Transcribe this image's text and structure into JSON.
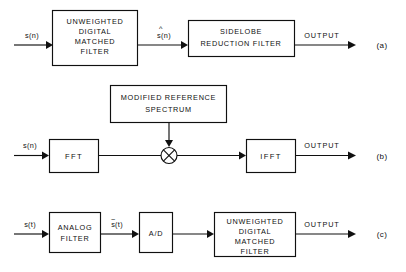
{
  "diagram": {
    "stroke_color": "#101010",
    "background_color": "#ffffff",
    "rows": [
      {
        "tag": "(a)",
        "input_label": "s(n)",
        "intermediate_labels": [
          "ŝ(n)"
        ],
        "output_label": "OUTPUT",
        "blocks": [
          {
            "name": "unweighted-digital-matched-filter",
            "lines": [
              "UNWEIGHTED",
              "DIGITAL",
              "MATCHED",
              "FILTER"
            ]
          },
          {
            "name": "sidelobe-reduction-filter",
            "lines": [
              "SIDELOBE",
              "REDUCTION FILTER"
            ]
          }
        ]
      },
      {
        "tag": "(b)",
        "input_label": "s(n)",
        "intermediate_labels": [],
        "output_label": "OUTPUT",
        "blocks": [
          {
            "name": "fft",
            "lines": [
              "FFT"
            ]
          },
          {
            "name": "modified-reference-spectrum",
            "lines": [
              "MODIFIED REFERENCE",
              "SPECTRUM"
            ]
          },
          {
            "name": "multiplier",
            "lines": [
              "⊗"
            ]
          },
          {
            "name": "ifft",
            "lines": [
              "IFFT"
            ]
          }
        ]
      },
      {
        "tag": "(c)",
        "input_label": "s(t)",
        "intermediate_labels": [
          "s̃(t)"
        ],
        "output_label": "OUTPUT",
        "blocks": [
          {
            "name": "analog-filter",
            "lines": [
              "ANALOG",
              "FILTER"
            ]
          },
          {
            "name": "analog-to-digital-converter",
            "lines": [
              "A/D"
            ]
          },
          {
            "name": "unweighted-digital-matched-filter",
            "lines": [
              "UNWEIGHTED",
              "DIGITAL",
              "MATCHED",
              "FILTER"
            ]
          }
        ]
      }
    ],
    "text": {
      "a_b1_l1": "UNWEIGHTED",
      "a_b1_l2": "DIGITAL",
      "a_b1_l3": "MATCHED",
      "a_b1_l4": "FILTER",
      "a_b2_l1": "SIDELOBE",
      "a_b2_l2": "REDUCTION FILTER",
      "a_in": "s(n)",
      "a_mid_base": "s(n)",
      "a_mid_hat": "^",
      "a_out": "OUTPUT",
      "a_tag": "(a)",
      "b_mrs_l1": "MODIFIED REFERENCE",
      "b_mrs_l2": "SPECTRUM",
      "b_fft": "FFT",
      "b_ifft": "IFFT",
      "b_in": "s(n)",
      "b_out": "OUTPUT",
      "b_tag": "(b)",
      "c_b1_l1": "ANALOG",
      "c_b1_l2": "FILTER",
      "c_ad": "A/D",
      "c_b3_l1": "UNWEIGHTED",
      "c_b3_l2": "DIGITAL",
      "c_b3_l3": "MATCHED",
      "c_b3_l4": "FILTER",
      "c_in": "s(t)",
      "c_mid_base": "s(t)",
      "c_mid_tilde": "~",
      "c_out": "OUTPUT",
      "c_tag": "(c)"
    }
  }
}
